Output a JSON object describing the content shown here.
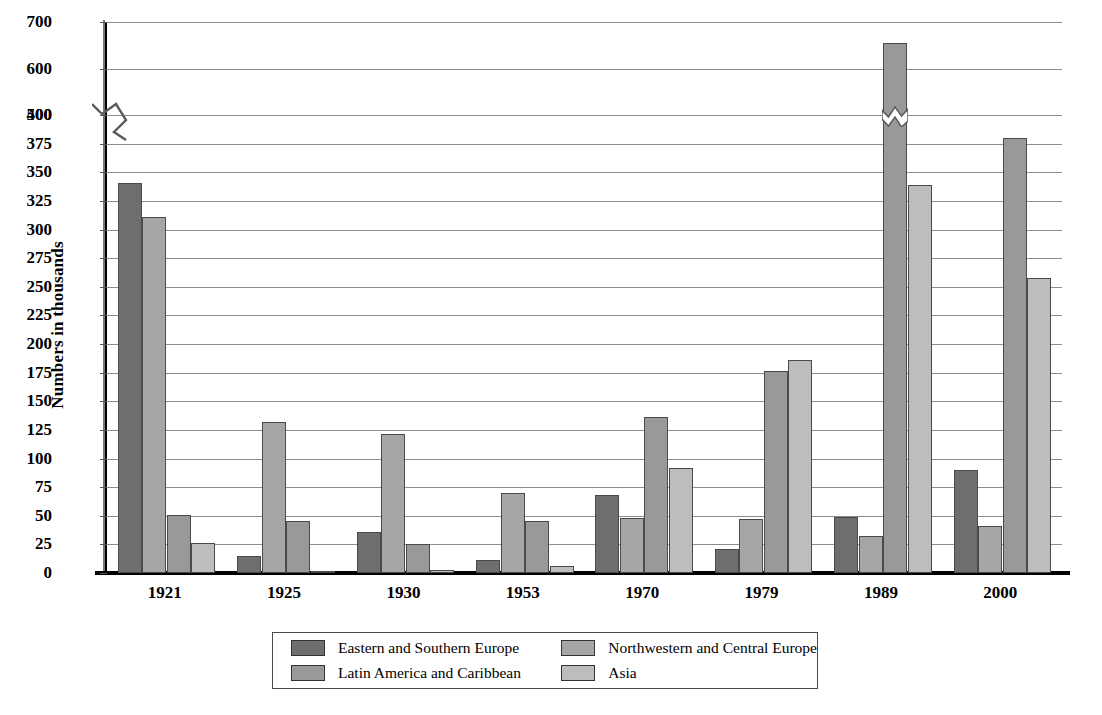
{
  "chart_data": {
    "type": "bar",
    "title": "",
    "subtitle": "",
    "xlabel": "",
    "ylabel": "Numbers in thousands",
    "categories": [
      "1921",
      "1925",
      "1930",
      "1953",
      "1970",
      "1979",
      "1989",
      "2000"
    ],
    "series": [
      {
        "name": "Eastern and Southern Europe",
        "color": "#6e6e6e",
        "values": [
          341,
          15,
          36,
          11,
          68,
          21,
          49,
          90
        ]
      },
      {
        "name": "Northwestern and Central Europe",
        "color": "#a6a6a6",
        "values": [
          311,
          132,
          121,
          70,
          48,
          47,
          32,
          41
        ]
      },
      {
        "name": "Latin America and Caribbean",
        "color": "#999999",
        "values": [
          51,
          45,
          25,
          45,
          136,
          176,
          655,
          380
        ]
      },
      {
        "name": "Asia",
        "color": "#bdbdbd",
        "values": [
          26,
          2,
          3,
          6,
          92,
          186,
          339,
          258
        ]
      }
    ],
    "ylim": [
      0,
      700
    ],
    "yticks": [
      0,
      25,
      50,
      75,
      100,
      125,
      150,
      175,
      200,
      225,
      250,
      275,
      300,
      325,
      350,
      375,
      400,
      500,
      600,
      700
    ],
    "axis_break": {
      "below": 400,
      "above": 500,
      "present": true
    },
    "grid": true,
    "legend_position": "bottom"
  },
  "legend": {
    "items": [
      {
        "label": "Eastern and Southern Europe",
        "swatch": "s0"
      },
      {
        "label": "Northwestern and Central Europe",
        "swatch": "s1"
      },
      {
        "label": "Latin America and Caribbean",
        "swatch": "s2"
      },
      {
        "label": "Asia",
        "swatch": "s3"
      }
    ]
  }
}
